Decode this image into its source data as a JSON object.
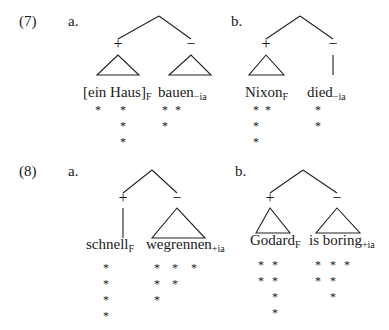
{
  "examples": [
    {
      "number": "(7)",
      "number_pos": [
        19,
        26
      ],
      "trees": [
        {
          "letter": "a.",
          "letter_pos": [
            68,
            26
          ],
          "apex": [
            159,
            16
          ],
          "children": [
            {
              "sign": "+",
              "sign_pos": [
                118,
                48
              ],
              "node": "triangle",
              "top": [
                118,
                55
              ],
              "base": [
                97,
                139,
                75
              ],
              "word": "[ein Haus]",
              "subscript": "F",
              "word_pos": [
                83,
                97
              ],
              "stars": [
                [
                  98,
                  110
                ],
                [
                  123,
                  110
                ],
                [
                  123,
                  126
                ],
                [
                  123,
                  142
                ]
              ]
            },
            {
              "sign": "−",
              "sign_pos": [
                191,
                48
              ],
              "node": "triangle",
              "top": [
                191,
                55
              ],
              "base": [
                169,
                211,
                75
              ],
              "word": "bauen",
              "subscript": "−ia",
              "word_pos": [
                158,
                97
              ],
              "stars": [
                [
                  165,
                  110
                ],
                [
                  178,
                  110
                ],
                [
                  165,
                  126
                ]
              ]
            }
          ]
        },
        {
          "letter": "b.",
          "letter_pos": [
            231,
            26
          ],
          "apex": [
            300,
            16
          ],
          "children": [
            {
              "sign": "+",
              "sign_pos": [
                266,
                48
              ],
              "node": "triangle",
              "top": [
                266,
                55
              ],
              "base": [
                249,
                284,
                75
              ],
              "word": "Nixon",
              "subscript": "F",
              "word_pos": [
                245,
                97
              ],
              "stars": [
                [
                  256,
                  110
                ],
                [
                  268,
                  110
                ],
                [
                  256,
                  126
                ],
                [
                  256,
                  142
                ]
              ]
            },
            {
              "sign": "−",
              "sign_pos": [
                333,
                48
              ],
              "node": "line",
              "top": [
                333,
                55
              ],
              "base": [
                333,
                333,
                75
              ],
              "word": "died",
              "subscript": "−ia",
              "word_pos": [
                307,
                97
              ],
              "stars": [
                [
                  318,
                  110
                ],
                [
                  318,
                  126
                ]
              ]
            }
          ]
        }
      ]
    },
    {
      "number": "(8)",
      "number_pos": [
        19,
        176
      ],
      "trees": [
        {
          "letter": "a.",
          "letter_pos": [
            68,
            176
          ],
          "apex": [
            152,
            170
          ],
          "children": [
            {
              "sign": "+",
              "sign_pos": [
                123,
                202
              ],
              "node": "line",
              "top": [
                123,
                208
              ],
              "base": [
                123,
                123,
                238
              ],
              "word": "schnell",
              "subscript": "F",
              "word_pos": [
                86,
                249
              ],
              "stars": [
                [
                  106,
                  268
                ],
                [
                  106,
                  284
                ],
                [
                  106,
                  300
                ],
                [
                  106,
                  316
                ]
              ]
            },
            {
              "sign": "−",
              "sign_pos": [
                177,
                202
              ],
              "node": "triangle",
              "top": [
                177,
                208
              ],
              "base": [
                152,
                205,
                238
              ],
              "word": "wegrennen",
              "subscript": "+ia",
              "word_pos": [
                146,
                249
              ],
              "stars": [
                [
                  157,
                  268
                ],
                [
                  175,
                  268
                ],
                [
                  194,
                  268
                ],
                [
                  157,
                  284
                ],
                [
                  175,
                  284
                ],
                [
                  157,
                  300
                ]
              ]
            }
          ]
        },
        {
          "letter": "b.",
          "letter_pos": [
            235,
            176
          ],
          "apex": [
            303,
            170
          ],
          "children": [
            {
              "sign": "+",
              "sign_pos": [
                270,
                202
              ],
              "node": "triangle",
              "top": [
                270,
                208
              ],
              "base": [
                256,
                290,
                233
              ],
              "word": "Godard",
              "subscript": "F",
              "word_pos": [
                250,
                245
              ],
              "stars": [
                [
                  261,
                  265
                ],
                [
                  275,
                  265
                ],
                [
                  261,
                  281
                ],
                [
                  275,
                  281
                ],
                [
                  275,
                  297
                ],
                [
                  275,
                  313
                ]
              ]
            },
            {
              "sign": "−",
              "sign_pos": [
                337,
                202
              ],
              "node": "triangle",
              "top": [
                337,
                208
              ],
              "base": [
                316,
                360,
                233
              ],
              "word": "is boring",
              "subscript": "+ia",
              "word_pos": [
                309,
                245
              ],
              "stars": [
                [
                  318,
                  265
                ],
                [
                  333,
                  265
                ],
                [
                  347,
                  265
                ],
                [
                  318,
                  281
                ],
                [
                  333,
                  281
                ],
                [
                  333,
                  297
                ]
              ]
            }
          ]
        }
      ]
    }
  ],
  "glyphs": {
    "star": "*"
  }
}
